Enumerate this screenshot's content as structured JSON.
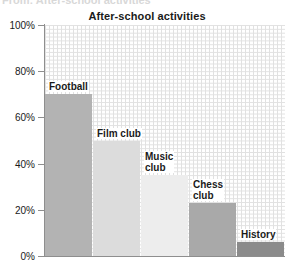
{
  "page": {
    "cutoff_text": "From: After-school activities"
  },
  "chart_data": {
    "type": "bar",
    "title": "After-school activities",
    "xlabel": "",
    "ylabel": "",
    "categories": [
      "Football",
      "Film club",
      "Music club",
      "Chess club",
      "History"
    ],
    "values": [
      70,
      50,
      35,
      23,
      6
    ],
    "value_suffix": "%",
    "ylim": [
      0,
      100
    ],
    "yticks": [
      0,
      20,
      40,
      60,
      80,
      100
    ],
    "ytick_labels": [
      "0%",
      "20%",
      "40%",
      "60%",
      "80%",
      "100%"
    ],
    "grid": true,
    "grid_style": "dotted",
    "legend": false,
    "bar_colors": [
      "#b3b3b3",
      "#dcdcdc",
      "#ededed",
      "#a9a9a9",
      "#8b8b8b"
    ],
    "label_lines": [
      [
        "Football"
      ],
      [
        "Film club"
      ],
      [
        "Music",
        "club"
      ],
      [
        "Chess",
        "club"
      ],
      [
        "History"
      ]
    ],
    "axis_color": "#8e8e8e",
    "background_color": "#ffffff",
    "text_color": "#1a1a1a"
  }
}
